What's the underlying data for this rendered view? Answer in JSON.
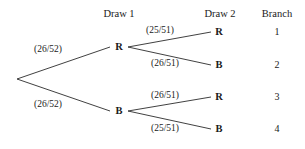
{
  "diagram": {
    "columns": [
      {
        "label": "Draw 1",
        "x": 119,
        "y": 14
      },
      {
        "label": "Draw 2",
        "x": 220,
        "y": 14
      },
      {
        "label": "Branch",
        "x": 277,
        "y": 14
      }
    ],
    "root": {
      "x": 17,
      "y": 79
    },
    "stroke_color": "#2b2b2b",
    "background_color": "#ffffff",
    "text_color": "#1a1a1a",
    "level1_nodes": [
      {
        "id": "r",
        "label": "R",
        "x": 119,
        "y": 47,
        "probability": "(26/52)",
        "prob_x": 48,
        "prob_y": 50
      },
      {
        "id": "b",
        "label": "B",
        "x": 119,
        "y": 111,
        "probability": "(26/52)",
        "prob_x": 48,
        "prob_y": 105
      }
    ],
    "level2_nodes": [
      {
        "id": "rr",
        "parent": "r",
        "label": "R",
        "x": 219,
        "y": 32,
        "probability": "(25/51)",
        "prob_x": 160,
        "prob_y": 31,
        "branch": "1",
        "branch_x": 277,
        "branch_y": 32
      },
      {
        "id": "rb",
        "parent": "r",
        "label": "B",
        "x": 219,
        "y": 65,
        "probability": "(26/51)",
        "prob_x": 165,
        "prob_y": 64,
        "branch": "2",
        "branch_x": 277,
        "branch_y": 65
      },
      {
        "id": "br",
        "parent": "b",
        "label": "R",
        "x": 219,
        "y": 97,
        "probability": "(26/51)",
        "prob_x": 165,
        "prob_y": 96,
        "branch": "3",
        "branch_x": 277,
        "branch_y": 97
      },
      {
        "id": "bb",
        "parent": "b",
        "label": "B",
        "x": 219,
        "y": 129,
        "probability": "(25/51)",
        "prob_x": 165,
        "prob_y": 129,
        "branch": "4",
        "branch_x": 277,
        "branch_y": 129
      }
    ]
  }
}
